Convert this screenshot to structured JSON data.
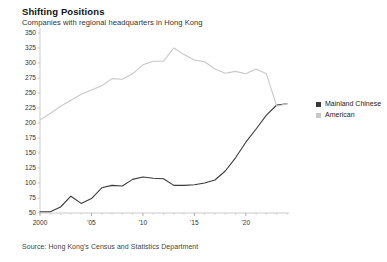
{
  "header": {
    "title": "Shifting Positions",
    "subtitle": "Companies with regional headquarters in Hong Kong"
  },
  "footer": {
    "source": "Source: Hong Kong's Census and Statistics Department"
  },
  "legend": {
    "items": [
      {
        "label": "Mainland Chinese",
        "color": "#3a3a3a"
      },
      {
        "label": "American",
        "color": "#c8c8c8"
      }
    ]
  },
  "chart_data": {
    "type": "line",
    "title": "Shifting Positions",
    "subtitle": "Companies with regional headquarters in Hong Kong",
    "xlabel": "",
    "ylabel": "",
    "xlim": [
      2000,
      2024
    ],
    "ylim": [
      50,
      350
    ],
    "yticks": [
      50,
      75,
      100,
      125,
      150,
      175,
      200,
      225,
      250,
      275,
      300,
      325,
      350
    ],
    "ytick_labels": [
      "50",
      "75",
      "100",
      "125",
      "150",
      "175",
      "200",
      "225",
      "250",
      "275",
      "300",
      "325",
      "350"
    ],
    "xticks": [
      2000,
      2005,
      2010,
      2015,
      2020
    ],
    "xtick_labels": [
      "2000",
      "'05",
      "'10",
      "'15",
      "'20"
    ],
    "grid": false,
    "legend_position": "right",
    "x": [
      2000,
      2001,
      2002,
      2003,
      2004,
      2005,
      2006,
      2007,
      2008,
      2009,
      2010,
      2011,
      2012,
      2013,
      2014,
      2015,
      2016,
      2017,
      2018,
      2019,
      2020,
      2021,
      2022,
      2023,
      2024
    ],
    "series": [
      {
        "name": "Mainland Chinese",
        "color": "#3a3a3a",
        "values": [
          52,
          52,
          60,
          78,
          66,
          74,
          92,
          96,
          95,
          106,
          110,
          108,
          107,
          96,
          96,
          97,
          100,
          105,
          120,
          142,
          168,
          190,
          213,
          230,
          232
        ]
      },
      {
        "name": "American",
        "color": "#c8c8c8",
        "values": [
          205,
          216,
          228,
          238,
          248,
          255,
          262,
          274,
          273,
          282,
          297,
          303,
          303,
          325,
          314,
          305,
          302,
          290,
          283,
          286,
          282,
          290,
          282,
          228,
          232
        ]
      }
    ]
  }
}
